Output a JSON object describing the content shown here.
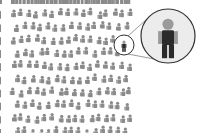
{
  "illustration": {
    "title": "",
    "description": "Crowd of gray person icons with one dark highlighted figure magnified in a circle",
    "colors": {
      "background": "#ffffff",
      "crowd_figure": "#8a8a8a",
      "highlight_body": "#2a2a2a",
      "highlight_head": "#9a9a9a",
      "magnifier_fill": "#ececec",
      "magnifier_stroke": "#333333",
      "connector_line": "#555555"
    },
    "crowd": {
      "x_min": 14,
      "x_max": 130,
      "y_min": 10,
      "y_max": 128,
      "cols": 16,
      "rows": 10
    },
    "highlight": {
      "x": 124,
      "y": 45
    },
    "small_circle": {
      "cx": 124,
      "cy": 45,
      "r": 10
    },
    "big_circle": {
      "cx": 168,
      "cy": 36,
      "r": 27
    }
  }
}
